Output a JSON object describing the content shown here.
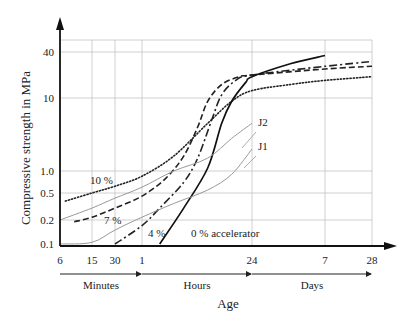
{
  "chart_data": {
    "type": "line",
    "title": "",
    "xlabel": "Age",
    "ylabel": "Compressive strength in MPa",
    "x_scale": "log",
    "y_scale": "log",
    "x_unit": "minutes",
    "x_ticks": [
      {
        "value": 6,
        "label": "6"
      },
      {
        "value": 15,
        "label": "15"
      },
      {
        "value": 30,
        "label": "30"
      },
      {
        "value": 60,
        "label": "1"
      },
      {
        "value": 1440,
        "label": "24"
      },
      {
        "value": 10080,
        "label": "7"
      },
      {
        "value": 40320,
        "label": "28"
      }
    ],
    "x_units": [
      {
        "label": "Minutes",
        "from": 6,
        "to": 60
      },
      {
        "label": "Hours",
        "from": 60,
        "to": 1440
      },
      {
        "label": "Days",
        "from": 1440,
        "to": 40320
      }
    ],
    "y_ticks": [
      {
        "value": 0.1,
        "label": "0.1"
      },
      {
        "value": 0.2,
        "label": "0.2"
      },
      {
        "value": 0.5,
        "label": "0.5"
      },
      {
        "value": 1.0,
        "label": "1.0"
      },
      {
        "value": 10,
        "label": "10"
      },
      {
        "value": 40,
        "label": "40"
      }
    ],
    "ylim": [
      0.1,
      40
    ],
    "xlim": [
      6,
      40320
    ],
    "grid": true,
    "legend": "inline labels",
    "series": [
      {
        "name": "10 %",
        "style": "dotted",
        "color": "#222222",
        "points": [
          [
            7,
            0.38
          ],
          [
            15,
            0.5
          ],
          [
            30,
            0.62
          ],
          [
            60,
            0.85
          ],
          [
            150,
            1.6
          ],
          [
            400,
            4.5
          ],
          [
            800,
            9
          ],
          [
            1440,
            12.5
          ],
          [
            4000,
            15
          ],
          [
            10080,
            17
          ],
          [
            40320,
            19
          ]
        ]
      },
      {
        "name": "7 %",
        "style": "dashed",
        "color": "#222222",
        "points": [
          [
            9,
            0.19
          ],
          [
            15,
            0.22
          ],
          [
            30,
            0.3
          ],
          [
            60,
            0.45
          ],
          [
            120,
            0.8
          ],
          [
            200,
            1.6
          ],
          [
            300,
            4
          ],
          [
            400,
            9
          ],
          [
            600,
            15
          ],
          [
            1000,
            19
          ],
          [
            1440,
            20
          ],
          [
            10080,
            24
          ],
          [
            40320,
            26
          ]
        ]
      },
      {
        "name": "4 %",
        "style": "dash-dot",
        "color": "#222222",
        "points": [
          [
            30,
            0.1
          ],
          [
            60,
            0.17
          ],
          [
            100,
            0.3
          ],
          [
            200,
            0.7
          ],
          [
            300,
            1.5
          ],
          [
            450,
            5
          ],
          [
            600,
            11
          ],
          [
            900,
            17
          ],
          [
            1440,
            20
          ],
          [
            10080,
            26
          ],
          [
            40320,
            30
          ]
        ]
      },
      {
        "name": "0 % accelerator",
        "style": "solid",
        "color": "#111111",
        "points": [
          [
            100,
            0.1
          ],
          [
            200,
            0.3
          ],
          [
            400,
            1.1
          ],
          [
            600,
            4.5
          ],
          [
            800,
            9
          ],
          [
            1200,
            16
          ],
          [
            1440,
            19
          ],
          [
            4000,
            28
          ],
          [
            10080,
            36
          ]
        ]
      },
      {
        "name": "J2",
        "style": "solid-thin",
        "color": "#999999",
        "points": [
          [
            6,
            0.2
          ],
          [
            15,
            0.3
          ],
          [
            30,
            0.42
          ],
          [
            60,
            0.6
          ],
          [
            150,
            1.0
          ],
          [
            400,
            1.5
          ],
          [
            800,
            2.8
          ],
          [
            1440,
            4.5
          ]
        ]
      },
      {
        "name": "J1",
        "style": "solid-thin",
        "color": "#999999",
        "points": [
          [
            6,
            0.1
          ],
          [
            15,
            0.105
          ],
          [
            30,
            0.15
          ],
          [
            60,
            0.22
          ],
          [
            150,
            0.35
          ],
          [
            400,
            0.55
          ],
          [
            800,
            0.9
          ],
          [
            1440,
            2.0
          ]
        ]
      }
    ],
    "annotations": [
      {
        "text": "10 %",
        "x_px": 90,
        "y_px": 184
      },
      {
        "text": "7 %",
        "x_px": 104,
        "y_px": 224
      },
      {
        "text": "4 %",
        "x_px": 148,
        "y_px": 237
      },
      {
        "text": "0 % accelerator",
        "x_px": 191,
        "y_px": 237
      },
      {
        "text": "J2",
        "x_px": 258,
        "y_px": 126
      },
      {
        "text": "J1",
        "x_px": 258,
        "y_px": 150
      }
    ]
  }
}
